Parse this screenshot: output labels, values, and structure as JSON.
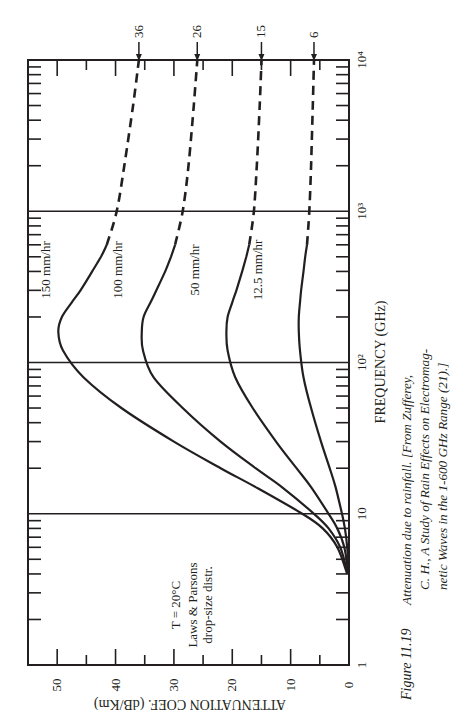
{
  "chart_data": {
    "type": "line",
    "orientation": "rotated-90-ccw",
    "title": "",
    "xlabel": "FREQUENCY (GHz)",
    "ylabel": "ATTENUATION COEF.  (dB/Km)",
    "xscale": "log",
    "xlim": [
      1,
      10000
    ],
    "ylim": [
      0,
      55
    ],
    "x_ticks": [
      {
        "value": 1,
        "label": "1"
      },
      {
        "value": 10,
        "label": "10"
      },
      {
        "value": 100,
        "label": "10²"
      },
      {
        "value": 1000,
        "label": "10³"
      },
      {
        "value": 10000,
        "label": "10⁴"
      }
    ],
    "y_ticks": [
      {
        "value": 0,
        "label": "0"
      },
      {
        "value": 10,
        "label": "10"
      },
      {
        "value": 20,
        "label": "20"
      },
      {
        "value": 30,
        "label": "30"
      },
      {
        "value": 40,
        "label": "40"
      },
      {
        "value": 50,
        "label": "50"
      }
    ],
    "grid": "vertical lines at each frequency decade",
    "annotation": {
      "lines": [
        "T = 20°C",
        "Laws & Parsons",
        "drop-size distr."
      ]
    },
    "series": [
      {
        "name": "150 mm/hr",
        "end_value_label": "36",
        "solid": {
          "x": [
            4,
            6,
            8,
            10,
            15,
            20,
            30,
            50,
            80,
            120,
            160,
            200,
            250,
            300,
            400,
            500,
            600
          ],
          "values": [
            0.3,
            2,
            4.5,
            8,
            16,
            22,
            30,
            39,
            45.5,
            49,
            49.8,
            49.2,
            47.5,
            46,
            44,
            42.5,
            41.5
          ]
        },
        "dashed": {
          "x": [
            600,
            1000,
            2000,
            5000,
            10000
          ],
          "values": [
            41.5,
            39.8,
            38.5,
            37,
            36
          ]
        }
      },
      {
        "name": "100 mm/hr",
        "end_value_label": "26",
        "solid": {
          "x": [
            4,
            6,
            8,
            10,
            15,
            20,
            30,
            50,
            80,
            120,
            160,
            200,
            250,
            300,
            400,
            500,
            600
          ],
          "values": [
            0.2,
            1.5,
            3.5,
            6,
            11.5,
            16,
            22,
            28.5,
            33.5,
            35.3,
            35.5,
            35.2,
            34,
            33,
            31.5,
            30.5,
            29.8
          ]
        },
        "dashed": {
          "x": [
            600,
            1000,
            2000,
            5000,
            10000
          ],
          "values": [
            29.8,
            28.5,
            27.5,
            26.6,
            26
          ]
        }
      },
      {
        "name": "50 mm/hr",
        "end_value_label": "15",
        "solid": {
          "x": [
            4,
            6,
            8,
            10,
            15,
            20,
            30,
            50,
            80,
            120,
            160,
            200,
            250,
            300,
            400,
            500,
            600
          ],
          "values": [
            0.1,
            0.8,
            2,
            3.5,
            6.5,
            9,
            12.5,
            16.5,
            19.5,
            20.8,
            21,
            20.8,
            20,
            19.3,
            18.3,
            17.6,
            17.1
          ]
        },
        "dashed": {
          "x": [
            600,
            1000,
            2000,
            5000,
            10000
          ],
          "values": [
            17.1,
            16.3,
            15.8,
            15.3,
            15
          ]
        }
      },
      {
        "name": "12.5 mm/hr",
        "end_value_label": "6",
        "solid": {
          "x": [
            4,
            6,
            8,
            10,
            15,
            20,
            30,
            50,
            80,
            120,
            160,
            200,
            250,
            300,
            400,
            500,
            600
          ],
          "values": [
            0.05,
            0.3,
            0.7,
            1.2,
            2.3,
            3.3,
            4.8,
            6.5,
            7.8,
            8.4,
            8.6,
            8.6,
            8.4,
            8.2,
            7.8,
            7.5,
            7.2
          ]
        },
        "dashed": {
          "x": [
            600,
            1000,
            2000,
            5000,
            10000
          ],
          "values": [
            7.2,
            6.8,
            6.5,
            6.2,
            6
          ]
        }
      }
    ]
  },
  "caption": {
    "figure_number": "Figure 11.19",
    "line1": "Attenuation due to rainfall. [From Zufferey,",
    "line2": "C. H., A Study of Rain Effects on Electromag-",
    "line3": "netic Waves in the 1-600 GHz Range (21).]"
  }
}
